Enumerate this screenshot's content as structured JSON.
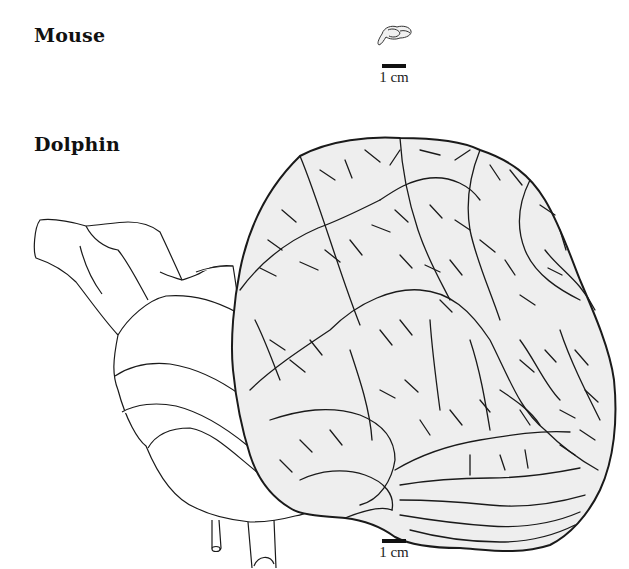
{
  "figure": {
    "panels": [
      {
        "id": "mouse",
        "label": "Mouse",
        "scale_bar": "1 cm"
      },
      {
        "id": "dolphin",
        "label": "Dolphin",
        "scale_bar": "1 cm"
      }
    ]
  },
  "colors": {
    "background": "#ffffff",
    "outline": "#1a1a1a",
    "cortex_fill": "#eeeeee",
    "text": "#111111"
  }
}
